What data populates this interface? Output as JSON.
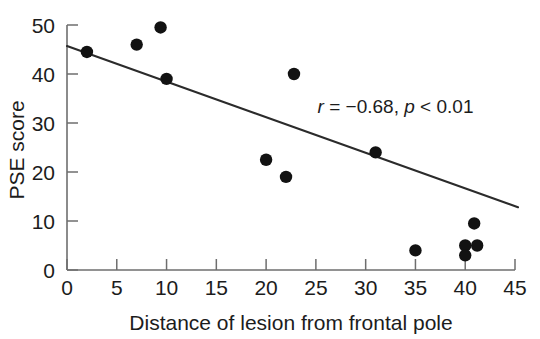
{
  "chart_data": {
    "type": "scatter",
    "title": "",
    "xlabel": "Distance of lesion from frontal pole",
    "ylabel": "PSE score",
    "xlim": [
      0,
      45
    ],
    "ylim": [
      0,
      50
    ],
    "xticks": [
      0,
      5,
      10,
      15,
      20,
      25,
      30,
      35,
      40,
      45
    ],
    "yticks": [
      0,
      10,
      20,
      30,
      40,
      50
    ],
    "xtick_labels": [
      "0",
      "5",
      "10",
      "15",
      "20",
      "25",
      "30",
      "35",
      "40",
      "45"
    ],
    "ytick_labels": [
      "0",
      "10",
      "20",
      "30",
      "40",
      "50"
    ],
    "grid": false,
    "legend": "none",
    "points": [
      {
        "x": 2.0,
        "y": 44.5
      },
      {
        "x": 7.0,
        "y": 46.0
      },
      {
        "x": 9.4,
        "y": 49.5
      },
      {
        "x": 10.0,
        "y": 39.0
      },
      {
        "x": 20.0,
        "y": 22.5
      },
      {
        "x": 22.0,
        "y": 19.0
      },
      {
        "x": 22.8,
        "y": 40.0
      },
      {
        "x": 31.0,
        "y": 24.0
      },
      {
        "x": 35.0,
        "y": 4.0
      },
      {
        "x": 40.9,
        "y": 9.5
      },
      {
        "x": 40.0,
        "y": 5.0
      },
      {
        "x": 41.2,
        "y": 5.0
      },
      {
        "x": 40.0,
        "y": 3.0
      }
    ],
    "fit_line": {
      "x_start": 0.0,
      "y_start": 45.7,
      "x_end": 45.3,
      "y_end": 12.8
    },
    "annotations": [
      {
        "name": "correlation-stats",
        "r_symbol": "r",
        "r_relation": " = ",
        "r_value": "−0.68,",
        "p_symbol": "p",
        "p_relation": " < ",
        "p_value": "0.01",
        "x": 33.0,
        "y": 32.0
      }
    ],
    "colors": {
      "point": "#121212",
      "fit_line": "#2b2b2b",
      "axis": "#6e6e6e",
      "text": "#1c1c1c",
      "background": "#ffffff"
    }
  }
}
